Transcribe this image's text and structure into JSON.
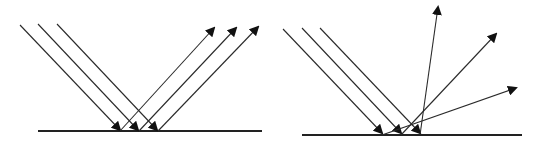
{
  "figures": [
    {
      "id": "specular-reflection",
      "ground": {
        "x1": 38,
        "y1": 131,
        "x2": 262,
        "y2": 131
      },
      "incident": [
        {
          "x1": 20,
          "y1": 25,
          "x2": 120,
          "y2": 130
        },
        {
          "x1": 38,
          "y1": 24,
          "x2": 138,
          "y2": 130
        },
        {
          "x1": 57,
          "y1": 24,
          "x2": 157,
          "y2": 130
        }
      ],
      "reflected": [
        {
          "x1": 120,
          "y1": 131,
          "x2": 214,
          "y2": 28
        },
        {
          "x1": 139,
          "y1": 131,
          "x2": 236,
          "y2": 28
        },
        {
          "x1": 158,
          "y1": 131,
          "x2": 258,
          "y2": 27
        }
      ]
    },
    {
      "id": "diffuse-reflection",
      "ground": {
        "x1": 302,
        "y1": 135,
        "x2": 522,
        "y2": 135
      },
      "incident": [
        {
          "x1": 283,
          "y1": 29,
          "x2": 382,
          "y2": 133
        },
        {
          "x1": 302,
          "y1": 28,
          "x2": 401,
          "y2": 133
        },
        {
          "x1": 320,
          "y1": 28,
          "x2": 420,
          "y2": 133
        }
      ],
      "reflected": [
        {
          "x1": 420,
          "y1": 135,
          "x2": 438,
          "y2": 7
        },
        {
          "x1": 401,
          "y1": 135,
          "x2": 496,
          "y2": 34
        },
        {
          "x1": 382,
          "y1": 135,
          "x2": 516,
          "y2": 88
        }
      ]
    }
  ]
}
